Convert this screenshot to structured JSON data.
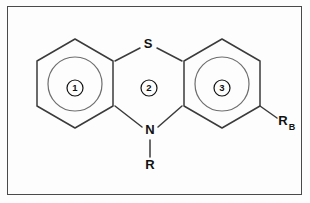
{
  "figure": {
    "background_color": "#fdfdfd",
    "border_color": "#4a4a4a",
    "bond_color": "#3b3b3b"
  },
  "atoms": {
    "sulfur": {
      "label": "S",
      "x": 148,
      "y": 45
    },
    "nitrogen": {
      "label": "N",
      "x": 150,
      "y": 131
    }
  },
  "substituents": {
    "n_substituent": {
      "label": "R",
      "x": 150,
      "y": 166
    },
    "ring3_substituent": {
      "label": "R",
      "subscript": "B",
      "x": 285,
      "y": 123
    }
  },
  "rings": [
    {
      "number": "1",
      "label_x": 75,
      "label_y": 88,
      "aromatic_circle": true,
      "cx": 75,
      "cy": 84,
      "r": 27
    },
    {
      "number": "2",
      "label_x": 149,
      "label_y": 88,
      "aromatic_circle": false,
      "cx": 149,
      "cy": 88,
      "r": 0
    },
    {
      "number": "3",
      "label_x": 222,
      "label_y": 88,
      "aromatic_circle": true,
      "cx": 222,
      "cy": 84,
      "r": 27
    }
  ],
  "bonds": {
    "s_left": "S to ring1 upper-right vertex",
    "s_right": "S to ring3 upper-left vertex",
    "n_left": "N to ring1 lower-right vertex",
    "n_right": "N to ring3 lower-left vertex",
    "n_to_r": "N down to R",
    "ring3_to_rb": "ring3 lower-right vertex to R_B"
  }
}
